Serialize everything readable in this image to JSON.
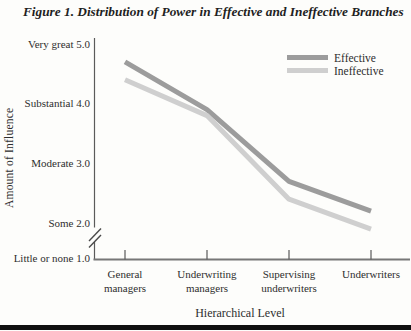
{
  "figure": {
    "bottom_rule_color": "#101010"
  },
  "chart_data": {
    "type": "line",
    "title": "Figure 1. Distribution of Power in Effective and Ineffective Branches",
    "xlabel": "Hierarchical Level",
    "ylabel": "Amount of Influence",
    "categories": [
      "General managers",
      "Underwriting managers",
      "Supervising underwriters",
      "Underwriters"
    ],
    "y_ticks": [
      {
        "label": "Very great",
        "value": 5.0
      },
      {
        "label": "Substantial",
        "value": 4.0
      },
      {
        "label": "Moderate",
        "value": 3.0
      },
      {
        "label": "Some",
        "value": 2.0
      },
      {
        "label": "Little or none",
        "value": 1.0
      }
    ],
    "ylim": [
      1.0,
      5.0
    ],
    "axis_break_between": [
      1.0,
      2.0
    ],
    "grid": false,
    "legend_position": "top-right",
    "axis_color": "#777777",
    "series": [
      {
        "name": "Effective",
        "color": "#9c9c9c",
        "values": [
          4.7,
          3.9,
          2.7,
          2.2
        ]
      },
      {
        "name": "Ineffective",
        "color": "#cfcfcf",
        "values": [
          4.4,
          3.8,
          2.4,
          1.9
        ]
      }
    ]
  }
}
